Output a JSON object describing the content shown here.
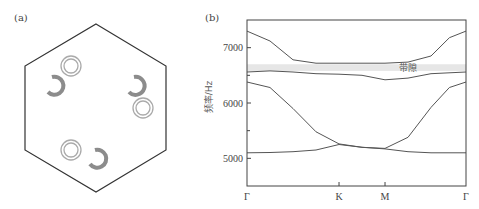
{
  "panel_a": {
    "label": "(a)",
    "description": "Hexagonal unit cell containing three pairs of split-ring and double-ring resonators",
    "colors": {
      "outline": "#333333",
      "split_ring": "#8c8c8c",
      "double_ring": "#aaaaaa"
    }
  },
  "panel_b": {
    "label": "(b)",
    "band_gap_label": "带隙",
    "ylabel": "频率/Hz"
  },
  "chart_data": {
    "type": "line",
    "title": "(b)",
    "xlabel": "",
    "ylabel": "频率/Hz",
    "x_tick_labels": [
      "Γ",
      "K",
      "M",
      "Γ"
    ],
    "x_tick_positions": [
      0,
      1,
      1.5,
      2.38
    ],
    "y_ticks": [
      5000,
      6000,
      7000
    ],
    "y_minor_ticks": [
      5500,
      6500
    ],
    "ylim": [
      4500,
      7500
    ],
    "xlim": [
      0,
      2.38
    ],
    "grid": false,
    "annotations": [
      {
        "text": "带隙",
        "type": "shaded_band",
        "y_range": [
          6580,
          6700
        ]
      }
    ],
    "series": [
      {
        "name": "band1",
        "x": [
          0,
          0.25,
          0.5,
          0.75,
          1.0,
          1.25,
          1.5,
          1.75,
          2.0,
          2.38
        ],
        "values": [
          5100,
          5105,
          5120,
          5150,
          5250,
          5200,
          5170,
          5120,
          5100,
          5100
        ]
      },
      {
        "name": "band2",
        "x": [
          0,
          0.25,
          0.5,
          0.75,
          1.0,
          1.25,
          1.5,
          1.75,
          2.0,
          2.2,
          2.38
        ],
        "values": [
          6380,
          6280,
          5900,
          5480,
          5260,
          5200,
          5180,
          5380,
          5920,
          6280,
          6380
        ]
      },
      {
        "name": "band3",
        "x": [
          0,
          0.25,
          0.5,
          0.75,
          1.0,
          1.25,
          1.5,
          1.75,
          2.0,
          2.38
        ],
        "values": [
          6560,
          6580,
          6560,
          6530,
          6520,
          6500,
          6420,
          6450,
          6530,
          6560
        ]
      },
      {
        "name": "band4",
        "x": [
          0,
          0.25,
          0.5,
          0.75,
          1.0,
          1.25,
          1.5,
          1.75,
          2.0,
          2.2,
          2.38
        ],
        "values": [
          7300,
          7120,
          6780,
          6720,
          6720,
          6720,
          6720,
          6740,
          6850,
          7180,
          7300
        ]
      }
    ]
  }
}
